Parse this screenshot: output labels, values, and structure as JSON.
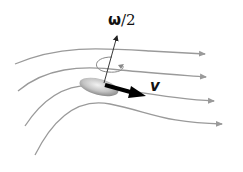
{
  "diagram": {
    "labels": {
      "omega_symbol": "ω",
      "omega_rest": "/2",
      "velocity": "v"
    },
    "colors": {
      "streamline": "#9a9a9a",
      "arrow": "#000000",
      "particle_light": "#e6e6e6",
      "particle_dark": "#8c8c8c"
    },
    "streamlines": [
      {
        "path": "M15,64 C60,45 100,48 150,51 L205,54",
        "arrow_tip": [
          208,
          54
        ]
      },
      {
        "path": "M18,91 C45,68 80,65 120,70 C150,73 180,75 206,77",
        "arrow_tip": [
          210,
          77
        ]
      },
      {
        "path": "M25,126 C45,95 70,82 100,86 C140,92 170,99 214,101",
        "arrow_tip": [
          218,
          101
        ]
      },
      {
        "path": "M35,155 C55,115 80,98 110,104 C150,112 165,123 222,124",
        "arrow_tip": [
          226,
          124
        ]
      }
    ]
  }
}
